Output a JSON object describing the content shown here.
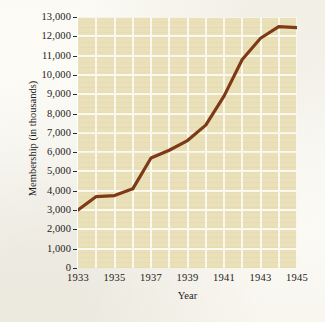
{
  "chart_data": {
    "type": "line",
    "title": "",
    "xlabel": "Year",
    "ylabel": "Membership (in thousands)",
    "xlim": [
      1933,
      1945
    ],
    "ylim": [
      0,
      13000
    ],
    "grid": true,
    "legend": false,
    "line_color": "#7E3A16",
    "plot_background": "#e9e0b8",
    "gridline_color": "#fbf8ee",
    "x_tick_labels": [
      "1933",
      "1935",
      "1937",
      "1939",
      "1941",
      "1943",
      "1945"
    ],
    "x_tick_values": [
      1933,
      1935,
      1937,
      1939,
      1941,
      1943,
      1945
    ],
    "y_tick_labels": [
      "0",
      "1,000",
      "2,000",
      "3,000",
      "4,000",
      "5,000",
      "6,000",
      "7,000",
      "8,000",
      "9,000",
      "10,000",
      "11,000",
      "12,000",
      "13,000"
    ],
    "y_tick_values": [
      0,
      1000,
      2000,
      3000,
      4000,
      5000,
      6000,
      7000,
      8000,
      9000,
      10000,
      11000,
      12000,
      13000
    ],
    "x": [
      1933,
      1934,
      1935,
      1936,
      1937,
      1938,
      1939,
      1940,
      1941,
      1942,
      1943,
      1944,
      1945
    ],
    "values": [
      3000,
      3700,
      3750,
      4100,
      5700,
      6100,
      6600,
      7400,
      8900,
      10800,
      11900,
      12500,
      12450
    ],
    "series": [
      {
        "name": "Union membership",
        "values": [
          3000,
          3700,
          3750,
          4100,
          5700,
          6100,
          6600,
          7400,
          8900,
          10800,
          11900,
          12500,
          12450
        ]
      }
    ]
  }
}
